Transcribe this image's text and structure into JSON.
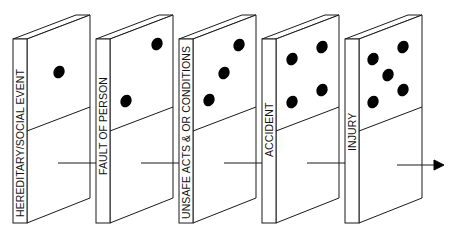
{
  "diagram": {
    "dominoes": [
      {
        "label": "HEREDITARY/SOCIAL EVENT",
        "pips": 1
      },
      {
        "label": "FAULT OF PERSON",
        "pips": 2
      },
      {
        "label": "UNSAFE ACTS & OR CONDITIONS",
        "pips": 3
      },
      {
        "label": "ACCIDENT",
        "pips": 4
      },
      {
        "label": "INJURY",
        "pips": 5
      }
    ],
    "arrow_icon": "arrow-right-icon",
    "line_color": "#1a1a1a",
    "pip_color": "#000000"
  },
  "caption": ""
}
